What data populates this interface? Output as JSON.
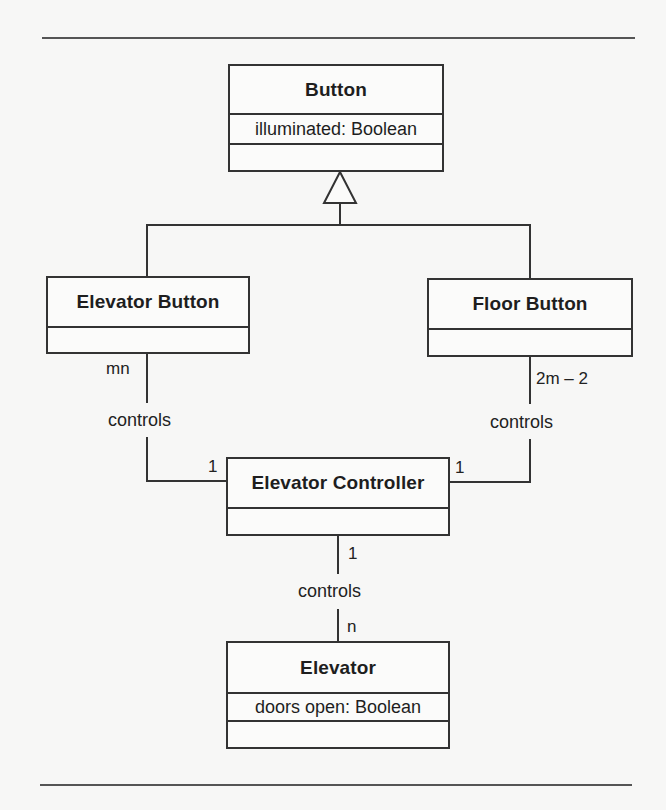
{
  "diagram": {
    "type": "UML class diagram",
    "classes": {
      "button": {
        "name": "Button",
        "attributes": [
          "illuminated: Boolean"
        ],
        "operations": []
      },
      "elevator_button": {
        "name": "Elevator Button",
        "attributes": [],
        "operations": []
      },
      "floor_button": {
        "name": "Floor Button",
        "attributes": [],
        "operations": []
      },
      "elevator_controller": {
        "name": "Elevator Controller",
        "attributes": [],
        "operations": []
      },
      "elevator": {
        "name": "Elevator",
        "attributes": [
          "doors open: Boolean"
        ],
        "operations": []
      }
    },
    "generalizations": [
      {
        "child": "Elevator Button",
        "parent": "Button"
      },
      {
        "child": "Floor Button",
        "parent": "Button"
      }
    ],
    "associations": {
      "elevator_button_controller": {
        "label": "controls",
        "from": "Elevator Button",
        "from_multiplicity": "mn",
        "to": "Elevator Controller",
        "to_multiplicity": "1"
      },
      "floor_button_controller": {
        "label": "controls",
        "from": "Floor Button",
        "from_multiplicity": "2m – 2",
        "to": "Elevator Controller",
        "to_multiplicity": "1"
      },
      "controller_elevator": {
        "label": "controls",
        "from": "Elevator Controller",
        "from_multiplicity": "1",
        "to": "Elevator",
        "to_multiplicity": "n"
      }
    }
  },
  "colors": {
    "background": "#f7f7f6",
    "line": "#333333",
    "text": "#1e1e1e"
  }
}
